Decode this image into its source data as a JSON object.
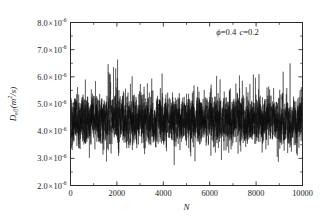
{
  "chart_data": {
    "type": "line",
    "title": "",
    "subtitle": "",
    "xlabel": "N",
    "ylabel": "D_eff(m^2/s)",
    "ylabel_parts": {
      "main": "D",
      "sub": "eff",
      "unit_open": "(m",
      "unit_sup": "2",
      "unit_close": "/s)"
    },
    "xlim": [
      0,
      10000
    ],
    "ylim": [
      2e-06,
      8e-06
    ],
    "grid": false,
    "legend": null,
    "x_ticks": [
      0,
      2000,
      4000,
      6000,
      8000,
      10000
    ],
    "x_ticklabels": [
      "0",
      "2000",
      "4000",
      "6000",
      "8000",
      "10000"
    ],
    "x_minor_ticks_per_interval": 1,
    "y_ticks": [
      2e-06,
      3e-06,
      4e-06,
      5e-06,
      6e-06,
      7e-06,
      8e-06
    ],
    "y_ticklabels": [
      {
        "mantissa": "2.0",
        "times": "×",
        "base": "10",
        "exponent": "-6"
      },
      {
        "mantissa": "3.0",
        "times": "×",
        "base": "10",
        "exponent": "-6"
      },
      {
        "mantissa": "4.0",
        "times": "×",
        "base": "10",
        "exponent": "-6"
      },
      {
        "mantissa": "5.0",
        "times": "×",
        "base": "10",
        "exponent": "-6"
      },
      {
        "mantissa": "6.0",
        "times": "×",
        "base": "10",
        "exponent": "-6"
      },
      {
        "mantissa": "7.0",
        "times": "×",
        "base": "10",
        "exponent": "-6"
      },
      {
        "mantissa": "8.0",
        "times": "×",
        "base": "10",
        "exponent": "-6"
      }
    ],
    "y_minor_ticks_per_interval": 1,
    "tick_direction": "in",
    "frame": "box",
    "annotations": [
      {
        "text": "ϕ=0.4 c=0.2",
        "symbol1": "ϕ",
        "value1": "=0.4",
        "symbol2": "c",
        "value2": "=0.2",
        "x": 7200,
        "y": 7.55e-06
      }
    ],
    "series": [
      {
        "name": "D_eff",
        "color": "#101010",
        "n_points": 10000,
        "mean": 4.4e-06,
        "std": 6.2e-07,
        "min_observed": 2.3e-06,
        "max_observed": 7.3e-06,
        "description": "Dense stationary random fluctuation of effective diffusivity versus sample index N"
      }
    ]
  }
}
